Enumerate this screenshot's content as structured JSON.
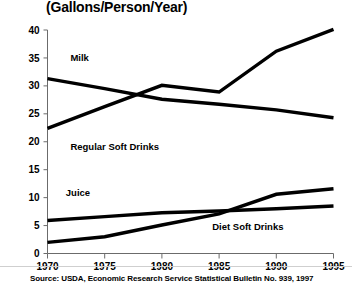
{
  "chart_data": {
    "type": "line",
    "title": "(Gallons/Person/Year)",
    "xlabel": "",
    "ylabel": "",
    "x": [
      1970,
      1975,
      1980,
      1985,
      1990,
      1995
    ],
    "xlim": [
      1970,
      1995
    ],
    "ylim": [
      0,
      40
    ],
    "yticks": [
      0,
      5,
      10,
      15,
      20,
      25,
      30,
      35,
      40
    ],
    "xticks": [
      "1970",
      "1975",
      "1980",
      "1985",
      "1990",
      "1995"
    ],
    "ytick_labels": [
      "0",
      "5",
      "10",
      "15",
      "20",
      "25",
      "30",
      "35",
      "40"
    ],
    "grid": false,
    "legend_position": "inline-labels",
    "line_color": "#000000",
    "series": [
      {
        "name": "Milk",
        "values": [
          31.3,
          29.5,
          27.6,
          26.7,
          25.7,
          24.3
        ],
        "label_x": 1972.0,
        "label_y": 34.5
      },
      {
        "name": "Regular Soft Drinks",
        "values": [
          22.4,
          26.3,
          30.1,
          28.9,
          36.2,
          40.1
        ],
        "label_x": 1972.0,
        "label_y": 18.5
      },
      {
        "name": "Juice",
        "values": [
          5.9,
          6.6,
          7.3,
          7.6,
          8.0,
          8.5
        ],
        "label_x": 1971.6,
        "label_y": 10.3
      },
      {
        "name": "Diet Soft Drinks",
        "values": [
          2.0,
          3.0,
          5.1,
          7.1,
          10.6,
          11.6
        ],
        "label_x": 1984.4,
        "label_y": 4.2
      }
    ],
    "source": "Source: USDA, Economic Research Service Statistical Bulletin No. 939, 1997"
  }
}
